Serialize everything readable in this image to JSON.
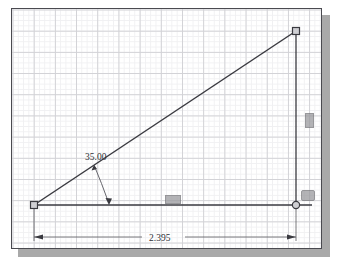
{
  "app": {
    "view_name": "sketch-canvas",
    "background_color": "#ffffff",
    "border_color": "#4a4a50",
    "shadow_color": "#a9a9a9",
    "geometry_color": "#3a3a40",
    "dimension_color": "#303035",
    "grid_major_color": "#d2d2d6",
    "grid_minor_color": "#f0f0f2"
  },
  "sketch": {
    "title": "Right triangle sketch with angle and length dimensions",
    "entities": [
      {
        "name": "baseline",
        "type": "line",
        "x1": 22,
        "y1": 196,
        "x2": 300,
        "y2": 196
      },
      {
        "name": "hypotenuse",
        "type": "line",
        "x1": 22,
        "y1": 196,
        "x2": 284,
        "y2": 22
      },
      {
        "name": "vertical-edge",
        "type": "line",
        "x1": 284,
        "y1": 22,
        "x2": 284,
        "y2": 196
      }
    ],
    "points": [
      {
        "name": "origin-point",
        "marker": "square",
        "x": 22,
        "y": 196
      },
      {
        "name": "apex-point",
        "marker": "square",
        "x": 284,
        "y": 22
      },
      {
        "name": "base-end-point",
        "marker": "circle",
        "x": 284,
        "y": 196
      }
    ]
  },
  "dimensions": {
    "angle": {
      "name": "angle-dimension",
      "value": "35.00",
      "unit": "degrees",
      "label_x": 73,
      "label_y": 148
    },
    "length": {
      "name": "horizontal-dimension",
      "value": "2.395",
      "unit": "inches",
      "label_x": 140,
      "label_y": 228
    }
  },
  "constraints": [
    {
      "name": "horizontal-constraint-glyph",
      "symbol": "horizontal",
      "x": 153,
      "y": 186,
      "width": 14,
      "height": 7
    },
    {
      "name": "coincident-constraint-glyph",
      "symbol": "coincident",
      "x": 289,
      "y": 181,
      "width": 12,
      "height": 9
    },
    {
      "name": "vertical-constraint-glyph",
      "symbol": "vertical",
      "x": 293,
      "y": 104,
      "width": 7,
      "height": 13
    }
  ]
}
